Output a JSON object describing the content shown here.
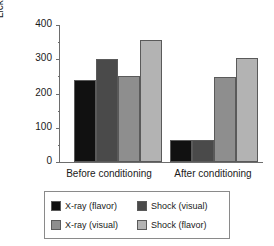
{
  "chart_data": {
    "type": "bar",
    "title": "",
    "xlabel": "",
    "ylabel": "Licks (per minute)",
    "categories": [
      "Before conditioning",
      "After conditioning"
    ],
    "ylim": [
      0,
      400
    ],
    "yticks": [
      0,
      100,
      200,
      300,
      400
    ],
    "ytick_labels": [
      "0",
      "100",
      "200",
      "300",
      "400"
    ],
    "minor_ticks": [
      50,
      150,
      250,
      350
    ],
    "grid": false,
    "legend_position": "bottom",
    "series": [
      {
        "name": "X-ray (flavor)",
        "color": "#111111",
        "values": [
          239,
          64
        ]
      },
      {
        "name": "Shock (visual)",
        "color": "#4a4a4a",
        "values": [
          301,
          64
        ]
      },
      {
        "name": "X-ray (visual)",
        "color": "#8e8e8e",
        "values": [
          251,
          248
        ]
      },
      {
        "name": "Shock (flavor)",
        "color": "#b3b3b3",
        "values": [
          355,
          304
        ]
      }
    ]
  },
  "axes": {
    "y_title": "Licks (per minute)",
    "y_labels": [
      "400",
      "300",
      "200",
      "100",
      "0"
    ],
    "x_labels": [
      "Before conditioning",
      "After conditioning"
    ]
  },
  "legend": {
    "entries": [
      {
        "label": "X-ray (flavor)",
        "color": "#111111"
      },
      {
        "label": "Shock (visual)",
        "color": "#4a4a4a"
      },
      {
        "label": "X-ray (visual)",
        "color": "#8e8e8e"
      },
      {
        "label": "Shock (flavor)",
        "color": "#b3b3b3"
      }
    ]
  }
}
